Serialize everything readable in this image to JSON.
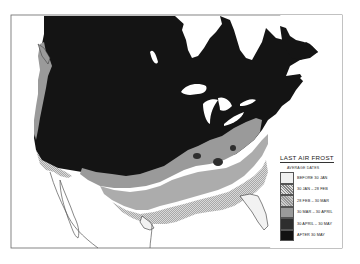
{
  "map": {
    "title": "LAST AIR FROST",
    "legend": {
      "subtitle": "AVERAGE DATES",
      "items": [
        {
          "label": "BEFORE 30 JAN",
          "fill": "#f0f0f0",
          "pattern": "solid"
        },
        {
          "label": "30 JAN – 28 FEB",
          "fill": "#cfcfcf",
          "pattern": "hatch"
        },
        {
          "label": "28 FEB – 30 MAR",
          "fill": "#b8b8b8",
          "pattern": "cross"
        },
        {
          "label": "30 MAR – 30 APRIL",
          "fill": "#9a9a9a",
          "pattern": "solid"
        },
        {
          "label": "30 APRIL – 30 MAY",
          "fill": "#2e2e2e",
          "pattern": "solid"
        },
        {
          "label": "AFTER 30 MAY",
          "fill": "#121212",
          "pattern": "solid"
        }
      ]
    },
    "colors": {
      "after_may": "#141414",
      "april_may": "#2e2e2e",
      "mar_april": "#9a9a9a",
      "feb_mar": "#bdbdbd",
      "jan_feb": "#d4d4d4",
      "before_jan": "#f2f2f2",
      "water": "#ffffff",
      "frame": "#666666"
    }
  }
}
